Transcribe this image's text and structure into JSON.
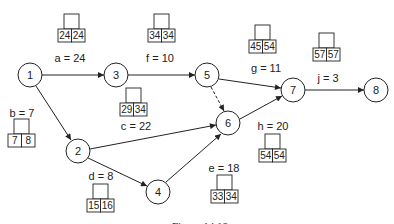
{
  "figure": {
    "caption": "Figure 14.18"
  },
  "nodes": [
    {
      "id": "1",
      "label": "1",
      "x": 30,
      "y": 75
    },
    {
      "id": "2",
      "label": "2",
      "x": 78,
      "y": 151
    },
    {
      "id": "3",
      "label": "3",
      "x": 116,
      "y": 75
    },
    {
      "id": "4",
      "label": "4",
      "x": 158,
      "y": 192
    },
    {
      "id": "5",
      "label": "5",
      "x": 207,
      "y": 75
    },
    {
      "id": "6",
      "label": "6",
      "x": 228,
      "y": 123
    },
    {
      "id": "7",
      "label": "7",
      "x": 293,
      "y": 90
    },
    {
      "id": "8",
      "label": "8",
      "x": 376,
      "y": 90
    }
  ],
  "activities": [
    {
      "name": "a",
      "duration": "24",
      "from": "1",
      "to": "3",
      "es": "24",
      "lf": "24",
      "label_text": "a = 24"
    },
    {
      "name": "b",
      "duration": "7",
      "from": "1",
      "to": "2",
      "es": "7",
      "lf": "8",
      "label_text": "b = 7"
    },
    {
      "name": "c",
      "duration": "22",
      "from": "2",
      "to": "6",
      "es": "29",
      "lf": "34",
      "label_text": "c = 22"
    },
    {
      "name": "d",
      "duration": "8",
      "from": "2",
      "to": "4",
      "es": "15",
      "lf": "16",
      "label_text": "d = 8"
    },
    {
      "name": "e",
      "duration": "18",
      "from": "4",
      "to": "6",
      "es": "33",
      "lf": "34",
      "label_text": "e = 18"
    },
    {
      "name": "f",
      "duration": "10",
      "from": "3",
      "to": "5",
      "es": "34",
      "lf": "34",
      "label_text": "f = 10"
    },
    {
      "name": "g",
      "duration": "11",
      "from": "5",
      "to": "7",
      "es": "45",
      "lf": "54",
      "label_text": "g = 11"
    },
    {
      "name": "h",
      "duration": "20",
      "from": "6",
      "to": "7",
      "es": "54",
      "lf": "54",
      "label_text": "h = 20"
    },
    {
      "name": "j",
      "duration": "3",
      "from": "7",
      "to": "8",
      "es": "57",
      "lf": "57",
      "label_text": "j = 3"
    },
    {
      "name": "dummy",
      "duration": "",
      "from": "5",
      "to": "6",
      "dashed": true
    }
  ]
}
